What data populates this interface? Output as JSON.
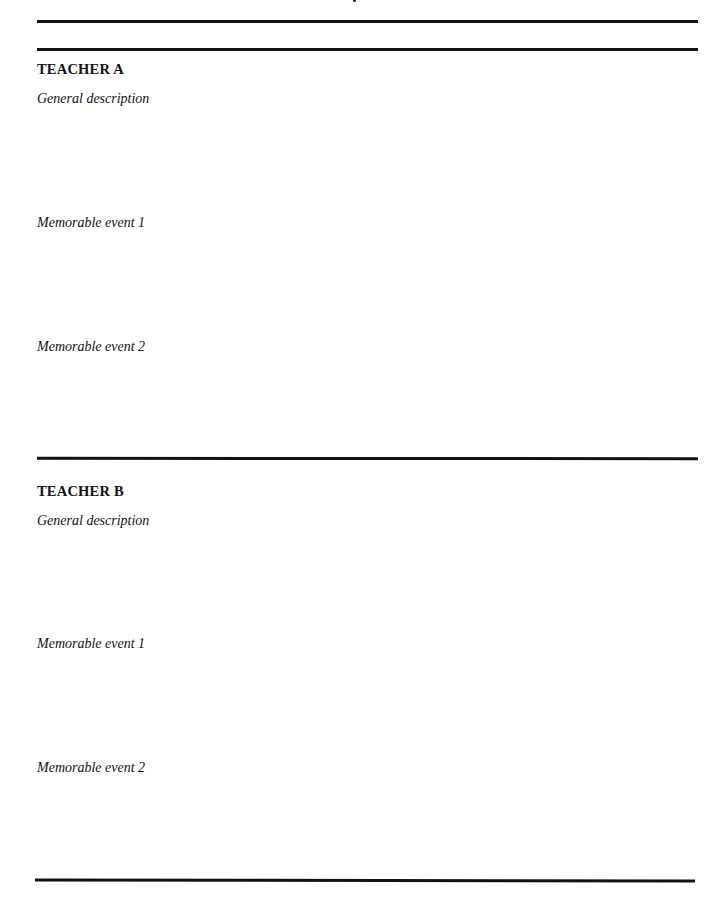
{
  "document": {
    "sections": [
      {
        "heading": "TEACHER A",
        "prompts": [
          "General description",
          "Memorable event 1",
          "Memorable event 2"
        ]
      },
      {
        "heading": "TEACHER B",
        "prompts": [
          "General description",
          "Memorable event 1",
          "Memorable event 2"
        ]
      }
    ]
  }
}
